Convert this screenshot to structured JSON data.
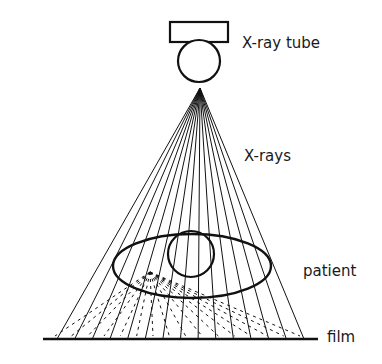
{
  "diagram": {
    "labels": {
      "tube": "X-ray tube",
      "rays": "X-rays",
      "patient": "patient",
      "film": "film"
    },
    "colors": {
      "stroke": "#111111",
      "background": "#ffffff"
    },
    "geometry": {
      "apex": [
        200,
        88
      ],
      "film_y": 339,
      "film_x": [
        43,
        318
      ],
      "ray_count": 15,
      "ray_x_start": 57,
      "ray_x_end": 304
    }
  }
}
